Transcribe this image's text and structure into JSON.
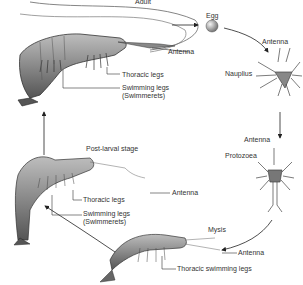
{
  "diagram": {
    "type": "life-cycle",
    "stages": [
      {
        "id": "adult",
        "label": "Adult",
        "annotations": [
          "Antenna",
          "Thoracic legs",
          "Swimming legs",
          "(Swimmerets)"
        ]
      },
      {
        "id": "egg",
        "label": "Egg",
        "annotations": []
      },
      {
        "id": "nauplius",
        "label": "Nauplius",
        "annotations": [
          "Antenna"
        ]
      },
      {
        "id": "protozoea",
        "label": "Protozoea",
        "annotations": [
          "Antenna"
        ]
      },
      {
        "id": "mysis",
        "label": "Mysis",
        "annotations": [
          "Antenna",
          "Thoracic swimming legs"
        ]
      },
      {
        "id": "postlarval",
        "label": "Post-larval stage",
        "annotations": [
          "Antenna",
          "Thoracic legs",
          "Swimming legs",
          "(Swimmerets)"
        ]
      }
    ],
    "flow": [
      "adult",
      "egg",
      "nauplius",
      "protozoea",
      "mysis",
      "postlarval",
      "adult"
    ]
  },
  "labels": {
    "adult": "Adult",
    "adult_antenna": "Antenna",
    "adult_thoracic": "Thoracic legs",
    "adult_swim1": "Swimming legs",
    "adult_swim2": "(Swimmerets)",
    "egg": "Egg",
    "nauplius_antenna": "Antenna",
    "nauplius": "Nauplius",
    "proto_antenna": "Antenna",
    "protozoea": "Protozoea",
    "postlarval": "Post-larval stage",
    "pl_antenna": "Antenna",
    "pl_thoracic": "Thoracic legs",
    "pl_swim1": "Swimming legs",
    "pl_swim2": "(Swimmerets)",
    "mysis": "Mysis",
    "mysis_antenna": "Antenna",
    "mysis_thoracic": "Thoracic swimming legs"
  }
}
